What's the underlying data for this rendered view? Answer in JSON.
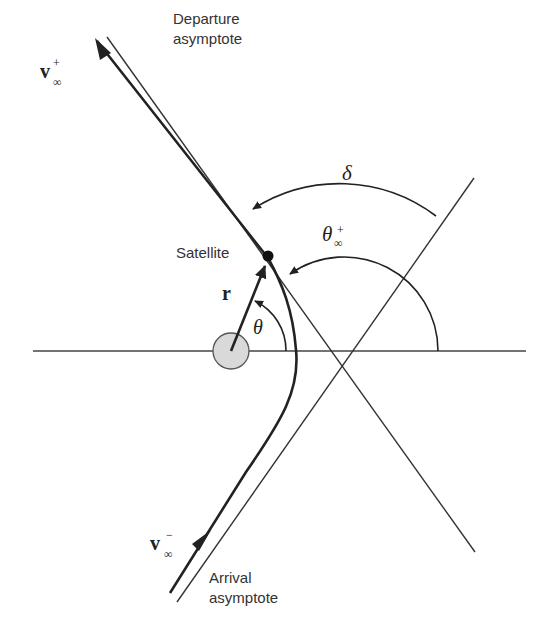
{
  "labels": {
    "departure_line1": "Departure",
    "departure_line2": "asymptote",
    "arrival_line1": "Arrival",
    "arrival_line2": "asymptote",
    "satellite": "Satellite",
    "r": "r",
    "theta": "θ",
    "delta": "δ",
    "theta_inf": "θ",
    "theta_inf_sup": "+",
    "theta_inf_sub": "∞",
    "v_plus": "v",
    "v_plus_sup": "+",
    "v_plus_sub": "∞",
    "v_minus": "v",
    "v_minus_sup": "−",
    "v_minus_sub": "∞"
  },
  "colors": {
    "line": "#333333",
    "planet_fill": "#d9d9d9"
  }
}
